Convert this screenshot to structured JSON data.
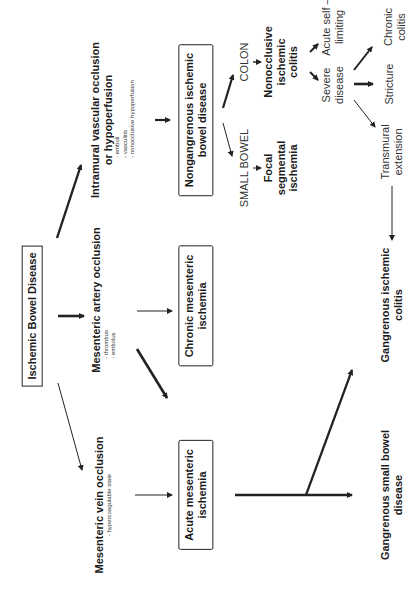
{
  "diagram": {
    "root": "Ischemic Bowel Disease",
    "causes": {
      "intramural": {
        "title_line1": "Intramural vascular occlusion",
        "title_line2": "or hypoperfusion",
        "items": [
          "- emboli",
          "- vasculitis",
          "- nonocclusive hypoperfusion"
        ]
      },
      "artery": {
        "title": "Mesenteric artery occlusion",
        "items": [
          "- thrombus",
          "- embolus"
        ]
      },
      "vein": {
        "title": "Mesenteric vein occlusion",
        "items": [
          "- hypercoagulable state"
        ]
      }
    },
    "conditions": {
      "nongangrenous_line1": "Nongangrenous ischemic",
      "nongangrenous_line2": "bowel disease",
      "chronic_line1": "Chronic mesenteric",
      "chronic_line2": "ischemia",
      "acute_line1": "Acute mesenteric",
      "acute_line2": "ischemia"
    },
    "sites": {
      "colon": "COLON",
      "small_bowel": "SMALL BOWEL"
    },
    "outcomes": {
      "nonocclusive_line1": "Nonocclusive",
      "nonocclusive_line2": "ischemic",
      "nonocclusive_line3": "colitis",
      "focal_line1": "Focal",
      "focal_line2": "segmental",
      "focal_line3": "ischemia",
      "acute_self_line1": "Acute self –",
      "acute_self_line2": "limiting",
      "severe_line1": "Severe",
      "severe_line2": "disease",
      "chronic_colitis_line1": "Chronic",
      "chronic_colitis_line2": "colitis",
      "stricture": "Stricture",
      "transmural_line1": "Transmural",
      "transmural_line2": "extension",
      "gangrenous_colitis_line1": "Gangrenous ischemic",
      "gangrenous_colitis_line2": "colitis",
      "gangrenous_sb_line1": "Gangrenous small bowel",
      "gangrenous_sb_line2": "disease"
    },
    "colors": {
      "stroke": "#222222",
      "background": "#ffffff"
    }
  }
}
